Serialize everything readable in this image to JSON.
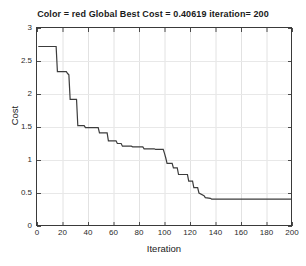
{
  "chart_data": {
    "type": "line",
    "title": "Color = red Global Best Cost = 0.40619 iteration= 200",
    "xlabel": "Iteration",
    "ylabel": "Cost",
    "xlim": [
      0,
      200
    ],
    "ylim": [
      0,
      3
    ],
    "xticks": [
      0,
      20,
      40,
      60,
      80,
      100,
      120,
      140,
      160,
      180,
      200
    ],
    "yticks": [
      0,
      0.5,
      1,
      1.5,
      2,
      2.5,
      3
    ],
    "xtick_labels": [
      "0",
      "20",
      "40",
      "60",
      "80",
      "100",
      "120",
      "140",
      "160",
      "180",
      "200"
    ],
    "ytick_labels": [
      "0",
      "0.5",
      "1",
      "1.5",
      "2",
      "2.5",
      "3"
    ],
    "grid": true,
    "legend": null,
    "line_color": "#3c3c3c",
    "line_width": 1.2,
    "series": [
      {
        "name": "Global Best Cost",
        "step": "post",
        "x": [
          1,
          15,
          16,
          23,
          24,
          25,
          26,
          31,
          32,
          37,
          38,
          48,
          49,
          55,
          56,
          62,
          63,
          66,
          67,
          74,
          75,
          83,
          84,
          92,
          93,
          99,
          100,
          101,
          102,
          106,
          107,
          110,
          111,
          118,
          119,
          122,
          123,
          126,
          127,
          131,
          132,
          136,
          137,
          200
        ],
        "y": [
          2.72,
          2.72,
          2.34,
          2.34,
          2.31,
          2.29,
          1.92,
          1.92,
          1.52,
          1.52,
          1.49,
          1.49,
          1.41,
          1.41,
          1.29,
          1.29,
          1.25,
          1.25,
          1.21,
          1.21,
          1.2,
          1.2,
          1.17,
          1.17,
          1.16,
          1.16,
          1.1,
          1.03,
          0.95,
          0.95,
          0.88,
          0.88,
          0.78,
          0.78,
          0.68,
          0.68,
          0.58,
          0.58,
          0.5,
          0.46,
          0.43,
          0.42,
          0.40619,
          0.40619
        ]
      }
    ],
    "annotation_values": {
      "global_best_cost": "0.40619",
      "final_iteration": "200",
      "color": "red"
    }
  }
}
